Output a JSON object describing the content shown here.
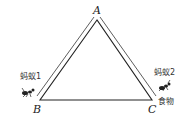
{
  "diagram": {
    "vertices": {
      "A": {
        "label": "A"
      },
      "B": {
        "label": "B"
      },
      "C": {
        "label": "C"
      }
    },
    "labels": {
      "ant1": "蚂蚁1",
      "ant2": "蚂蚁2",
      "food": "食物"
    },
    "line_color": "#222222"
  }
}
